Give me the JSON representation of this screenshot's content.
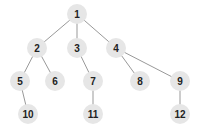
{
  "tree": {
    "nodes": [
      {
        "id": "1",
        "label": "1",
        "x": 77,
        "y": 14
      },
      {
        "id": "2",
        "label": "2",
        "x": 37,
        "y": 48
      },
      {
        "id": "3",
        "label": "3",
        "x": 77,
        "y": 48
      },
      {
        "id": "4",
        "label": "4",
        "x": 116,
        "y": 48
      },
      {
        "id": "5",
        "label": "5",
        "x": 20,
        "y": 81
      },
      {
        "id": "6",
        "label": "6",
        "x": 55,
        "y": 81
      },
      {
        "id": "7",
        "label": "7",
        "x": 93,
        "y": 81
      },
      {
        "id": "8",
        "label": "8",
        "x": 140,
        "y": 81
      },
      {
        "id": "9",
        "label": "9",
        "x": 180,
        "y": 81
      },
      {
        "id": "10",
        "label": "10",
        "x": 28,
        "y": 114
      },
      {
        "id": "11",
        "label": "11",
        "x": 93,
        "y": 114
      },
      {
        "id": "12",
        "label": "12",
        "x": 180,
        "y": 114
      }
    ],
    "edges": [
      [
        "1",
        "2"
      ],
      [
        "1",
        "3"
      ],
      [
        "1",
        "4"
      ],
      [
        "2",
        "5"
      ],
      [
        "2",
        "6"
      ],
      [
        "3",
        "7"
      ],
      [
        "4",
        "8"
      ],
      [
        "4",
        "9"
      ],
      [
        "5",
        "10"
      ],
      [
        "7",
        "11"
      ],
      [
        "9",
        "12"
      ]
    ]
  }
}
